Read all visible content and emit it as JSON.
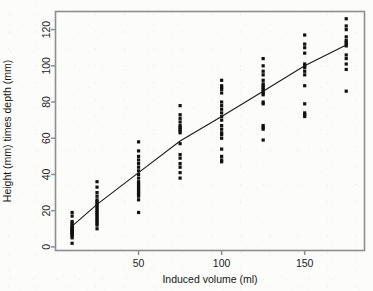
{
  "chart_data": {
    "type": "scatter",
    "title": "",
    "xlabel": "Induced volume (ml)",
    "ylabel": "Height (mm) times depth (mm)",
    "xlim": [
      0,
      186
    ],
    "ylim": [
      -2,
      130
    ],
    "xticks": [
      50,
      100,
      150
    ],
    "yticks": [
      0,
      20,
      40,
      60,
      80,
      100,
      120
    ],
    "grid": false,
    "legend": null,
    "point_color": "#111111",
    "point_marker": "square",
    "line_color": "#1a1a1a",
    "series": [
      {
        "name": "observations",
        "x": [
          10,
          10,
          10,
          10,
          10,
          10,
          10,
          10,
          10,
          10,
          10,
          10,
          10,
          10,
          10,
          10,
          10,
          10,
          25,
          25,
          25,
          25,
          25,
          25,
          25,
          25,
          25,
          25,
          25,
          25,
          25,
          25,
          25,
          25,
          25,
          25,
          25,
          25,
          50,
          50,
          50,
          50,
          50,
          50,
          50,
          50,
          50,
          50,
          50,
          50,
          50,
          50,
          50,
          50,
          50,
          50,
          50,
          50,
          75,
          75,
          75,
          75,
          75,
          75,
          75,
          75,
          75,
          75,
          75,
          75,
          75,
          75,
          75,
          75,
          100,
          100,
          100,
          100,
          100,
          100,
          100,
          100,
          100,
          100,
          100,
          100,
          100,
          100,
          100,
          100,
          100,
          100,
          100,
          100,
          125,
          125,
          125,
          125,
          125,
          125,
          125,
          125,
          125,
          125,
          125,
          125,
          125,
          125,
          125,
          125,
          125,
          125,
          150,
          150,
          150,
          150,
          150,
          150,
          150,
          150,
          150,
          150,
          150,
          150,
          150,
          150,
          175,
          175,
          175,
          175,
          175,
          175,
          175,
          175,
          175,
          175,
          175,
          175,
          175
        ],
        "y": [
          2,
          5,
          6,
          7,
          7,
          8,
          8,
          9,
          9,
          10,
          10,
          11,
          11,
          12,
          13,
          14,
          17,
          19,
          10,
          12,
          13,
          14,
          15,
          16,
          17,
          18,
          19,
          20,
          21,
          22,
          23,
          24,
          25,
          26,
          28,
          30,
          33,
          36,
          19,
          26,
          28,
          29,
          30,
          31,
          32,
          33,
          34,
          35,
          36,
          38,
          40,
          42,
          44,
          46,
          48,
          50,
          53,
          58,
          38,
          41,
          44,
          46,
          49,
          51,
          57,
          63,
          64,
          65,
          66,
          67,
          69,
          71,
          73,
          78,
          47,
          48,
          50,
          54,
          60,
          62,
          63,
          65,
          67,
          70,
          72,
          74,
          76,
          78,
          80,
          85,
          87,
          88,
          89,
          92,
          59,
          65,
          66,
          67,
          79,
          80,
          84,
          85,
          86,
          87,
          88,
          89,
          90,
          92,
          95,
          97,
          100,
          104,
          72,
          73,
          74,
          79,
          89,
          95,
          97,
          99,
          100,
          101,
          107,
          110,
          112,
          117,
          86,
          98,
          101,
          104,
          106,
          111,
          112,
          113,
          114,
          116,
          120,
          122,
          126
        ]
      }
    ],
    "fit_line": {
      "name": "fitted curve",
      "x": [
        10,
        25,
        50,
        75,
        100,
        125,
        150,
        175
      ],
      "y": [
        11.5,
        23.5,
        41.0,
        58.5,
        72.0,
        86.0,
        100.0,
        111.5
      ]
    }
  }
}
